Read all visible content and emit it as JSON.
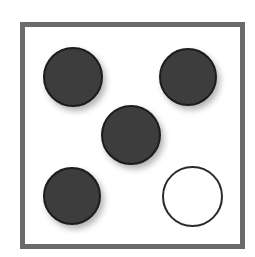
{
  "figure": {
    "background_color": "#ffffff",
    "frame": {
      "name": "square-border",
      "color": "#6b6b6b",
      "thickness_px": 5,
      "x": 20,
      "y": 22,
      "width": 225,
      "height": 227
    },
    "counts": {
      "filled": 4,
      "outlined": 1,
      "total": 5
    },
    "palette": {
      "fill_dark": "#3d3d3d",
      "rim_dark": "#1c1c1c",
      "outline_stroke": "#2a2a2a",
      "frame_gray": "#6b6b6b",
      "canvas_white": "#ffffff"
    },
    "circles": [
      {
        "id": "circle-top-left",
        "style": "filled",
        "fill": "#3d3d3d",
        "stroke": "#1c1c1c",
        "cx": 73,
        "cy": 77,
        "diameter": 60
      },
      {
        "id": "circle-top-right",
        "style": "filled",
        "fill": "#3d3d3d",
        "stroke": "#1c1c1c",
        "cx": 188,
        "cy": 77,
        "diameter": 58
      },
      {
        "id": "circle-center",
        "style": "filled",
        "fill": "#3d3d3d",
        "stroke": "#1c1c1c",
        "cx": 131,
        "cy": 135,
        "diameter": 60
      },
      {
        "id": "circle-bottom-left",
        "style": "filled",
        "fill": "#3d3d3d",
        "stroke": "#1c1c1c",
        "cx": 72,
        "cy": 196,
        "diameter": 58
      },
      {
        "id": "circle-bottom-right",
        "style": "outlined",
        "fill": "#ffffff",
        "stroke": "#2a2a2a",
        "cx": 192,
        "cy": 196,
        "diameter": 61
      }
    ]
  }
}
